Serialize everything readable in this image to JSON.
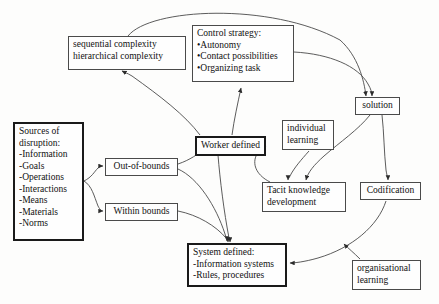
{
  "diagram": {
    "background_color": "#fdfdfc",
    "stroke_color": "#4a4a4a",
    "text_color": "#111111",
    "nodes": [
      {
        "id": "complexity",
        "name": "complexity-box",
        "lines": [
          "sequential complexity",
          "hierarchical complexity"
        ],
        "x": 68,
        "y": 36,
        "w": 118,
        "h": 34,
        "emphasis": "normal",
        "align": "left"
      },
      {
        "id": "control_strategy",
        "name": "control-strategy-box",
        "lines": [
          "Control strategy:",
          "•Autonomy",
          "•Contact possibilities",
          "•Organizing task"
        ],
        "x": 192,
        "y": 25,
        "w": 102,
        "h": 57,
        "emphasis": "normal",
        "align": "left"
      },
      {
        "id": "solution",
        "name": "solution-box",
        "lines": [
          "solution"
        ],
        "x": 355,
        "y": 97,
        "w": 45,
        "h": 17,
        "emphasis": "normal",
        "align": "center"
      },
      {
        "id": "sources",
        "name": "sources-of-disruption-box",
        "lines": [
          "Sources of",
          "disruption:",
          "-Information",
          "-Goals",
          "-Operations",
          "-Interactions",
          "-Means",
          "-Materials",
          "-Norms"
        ],
        "x": 13,
        "y": 122,
        "w": 71,
        "h": 119,
        "emphasis": "thick",
        "align": "left"
      },
      {
        "id": "worker_defined",
        "name": "worker-defined-box",
        "lines": [
          "Worker defined"
        ],
        "x": 195,
        "y": 136,
        "w": 71,
        "h": 18,
        "emphasis": "thick",
        "align": "center"
      },
      {
        "id": "out_of_bounds",
        "name": "out-of-bounds-box",
        "lines": [
          "Out-of-bounds"
        ],
        "x": 105,
        "y": 158,
        "w": 73,
        "h": 17,
        "emphasis": "normal",
        "align": "center"
      },
      {
        "id": "within_bounds",
        "name": "within-bounds-box",
        "lines": [
          "Within bounds"
        ],
        "x": 105,
        "y": 203,
        "w": 73,
        "h": 17,
        "emphasis": "normal",
        "align": "center"
      },
      {
        "id": "individual_learning",
        "name": "individual-learning-box",
        "lines": [
          "individual",
          "learning"
        ],
        "x": 282,
        "y": 120,
        "w": 52,
        "h": 30,
        "emphasis": "normal",
        "align": "left"
      },
      {
        "id": "tacit_knowledge",
        "name": "tacit-knowledge-development-box",
        "lines": [
          "Tacit knowledge",
          "development"
        ],
        "x": 262,
        "y": 182,
        "w": 84,
        "h": 30,
        "emphasis": "normal",
        "align": "left"
      },
      {
        "id": "codification",
        "name": "codification-box",
        "lines": [
          "Codification"
        ],
        "x": 360,
        "y": 182,
        "w": 61,
        "h": 18,
        "emphasis": "normal",
        "align": "center"
      },
      {
        "id": "system_defined",
        "name": "system-defined-box",
        "lines": [
          "System defined:",
          "-Information systems",
          "-Rules, procedures"
        ],
        "x": 187,
        "y": 243,
        "w": 100,
        "h": 44,
        "emphasis": "thick",
        "align": "left"
      },
      {
        "id": "organisational_learning",
        "name": "organisational-learning-box",
        "lines": [
          "organisational",
          "learning"
        ],
        "x": 352,
        "y": 260,
        "w": 69,
        "h": 30,
        "emphasis": "normal",
        "align": "left"
      }
    ],
    "edges": [
      {
        "id": "e1",
        "name": "edge-complexity-to-solution",
        "from": "complexity",
        "to": "solution",
        "path": "M 128 36 C 150 8 270 2 340 40 C 358 56 364 80 366 96",
        "arrow": true
      },
      {
        "id": "e2",
        "name": "edge-control-strategy-to-solution",
        "from": "control_strategy",
        "to": "solution",
        "path": "M 294 52 C 330 54 358 66 368 84 C 371 89 372 93 372 96",
        "arrow": true
      },
      {
        "id": "e3",
        "name": "edge-worker-defined-to-complexity",
        "from": "worker_defined",
        "to": "complexity",
        "path": "M 200 135 C 185 115 160 96 132 76 C 127 73 124 72 122 71",
        "arrow": true
      },
      {
        "id": "e4",
        "name": "edge-worker-defined-to-control-strategy",
        "from": "worker_defined",
        "to": "control_strategy",
        "path": "M 232 135 C 234 120 238 102 241 88",
        "arrow": true
      },
      {
        "id": "e5",
        "name": "edge-sources-to-out-of-bounds",
        "from": "sources",
        "to": "out_of_bounds",
        "path": "M 84 181 C 92 177 94 172 98 168 C 100 166 102 166 103 166",
        "arrow": true
      },
      {
        "id": "e6",
        "name": "edge-sources-to-within-bounds",
        "from": "sources",
        "to": "within_bounds",
        "path": "M 84 181 C 92 186 94 196 98 206 C 100 210 102 211 103 211",
        "arrow": true
      },
      {
        "id": "e7",
        "name": "edge-out-of-bounds-to-worker-defined",
        "from": "out_of_bounds",
        "to": "worker_defined",
        "path": "M 178 164 C 190 160 198 154 206 148 C 209 146 211 145 212 144",
        "arrow": true
      },
      {
        "id": "e8",
        "name": "edge-out-of-bounds-to-system-defined",
        "from": "out_of_bounds",
        "to": "system_defined",
        "path": "M 178 169 C 198 178 216 206 225 234 C 226 238 227 240 227 241",
        "arrow": true
      },
      {
        "id": "e9",
        "name": "edge-within-bounds-to-system-defined",
        "from": "within_bounds",
        "to": "system_defined",
        "path": "M 178 211 C 198 215 216 226 226 238 C 228 240 228 241 228 242",
        "arrow": true
      },
      {
        "id": "e10",
        "name": "edge-worker-defined-to-system-defined",
        "from": "worker_defined",
        "to": "system_defined",
        "path": "M 218 155 C 220 180 224 212 229 238 C 230 240 230 241 230 242",
        "arrow": true
      },
      {
        "id": "e11",
        "name": "edge-solution-to-tacit-knowledge",
        "from": "solution",
        "to": "tacit_knowledge",
        "path": "M 370 115 C 358 130 340 142 324 156 C 314 165 308 172 306 180",
        "arrow": true
      },
      {
        "id": "e12",
        "name": "edge-solution-to-codification",
        "from": "solution",
        "to": "codification",
        "path": "M 382 115 C 384 132 384 152 386 170 C 387 176 388 179 388 180",
        "arrow": true
      },
      {
        "id": "e13",
        "name": "edge-individual-learning-to-tacit-knowledge",
        "from": "individual_learning",
        "to": "tacit_knowledge",
        "path": "M 309 151 C 301 160 294 168 290 176 C 289 178 288 179 288 180",
        "arrow": true
      },
      {
        "id": "e14",
        "name": "edge-tacit-knowledge-to-worker-defined",
        "from": "tacit_knowledge",
        "to": "worker_defined",
        "path": "M 270 182 C 258 176 252 166 256 156 C 259 150 263 147 266 146",
        "arrow": true
      },
      {
        "id": "e15",
        "name": "edge-codification-to-system-defined",
        "from": "codification",
        "to": "system_defined",
        "path": "M 386 201 C 378 226 352 248 318 258 C 304 262 294 263 290 263",
        "arrow": true
      },
      {
        "id": "e16",
        "name": "edge-organisational-learning-to-codification-path",
        "from": "organisational_learning",
        "to": "codification",
        "path": "M 360 259 C 354 253 348 248 344 244",
        "arrow": true
      }
    ]
  }
}
